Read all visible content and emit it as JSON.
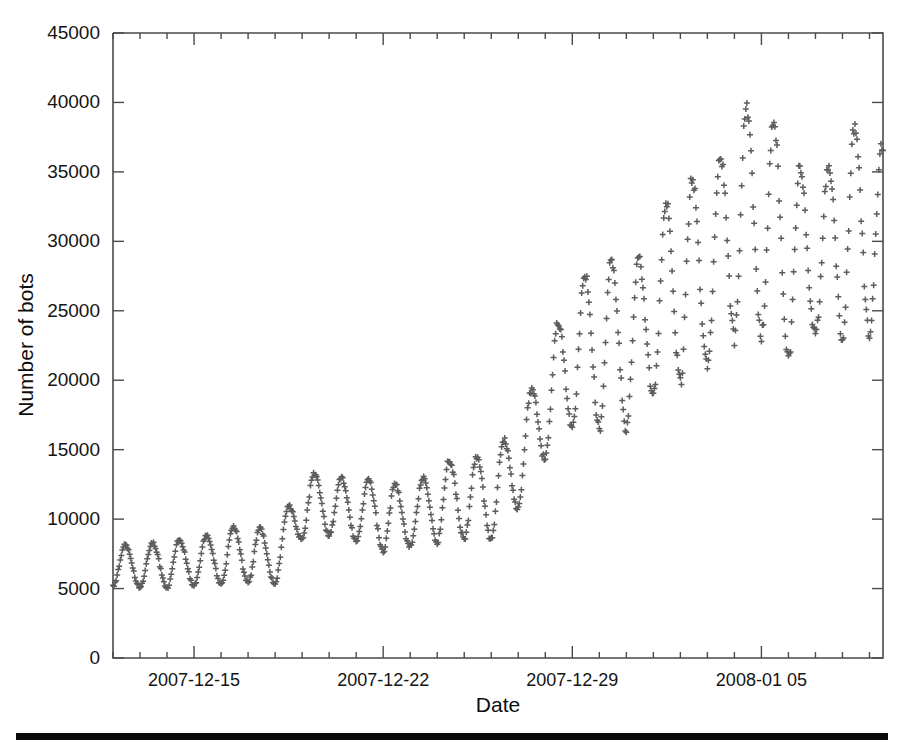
{
  "figure": {
    "background_color": "#ffffff",
    "marker_color": "#5d5d5d",
    "axis_color": "#4a4a4a",
    "rule_color": "#0a0a0a"
  },
  "chart_data": {
    "type": "scatter",
    "title": "",
    "xlabel": "Date",
    "ylabel": "Number of bots",
    "marker": "plus",
    "grid": false,
    "legend": null,
    "ylim": [
      0,
      45000
    ],
    "ytick_labels": [
      "0",
      "5000",
      "10000",
      "15000",
      "20000",
      "25000",
      "30000",
      "35000",
      "40000",
      "45000"
    ],
    "ytick_values": [
      0,
      5000,
      10000,
      15000,
      20000,
      25000,
      30000,
      35000,
      40000,
      45000
    ],
    "xtick_labels": [
      "2007-12-15",
      "2007-12-22",
      "2007-12-29",
      "2008-01 05"
    ],
    "xtick_day_index": [
      3,
      10,
      17,
      24
    ],
    "x_start_label": "2007-12-12",
    "x_end_label": "2008-01-09",
    "x_total_days": 28.5,
    "sampling": "approximately hourly samples showing a strong daily (diurnal) cycle",
    "series": [
      {
        "name": "Number of bots",
        "daily_cycles": [
          {
            "day": 0.0,
            "min": 5150,
            "max": 8200
          },
          {
            "day": 1.0,
            "min": 5050,
            "max": 8100
          },
          {
            "day": 2.0,
            "min": 5100,
            "max": 8500
          },
          {
            "day": 3.0,
            "min": 5200,
            "max": 8600
          },
          {
            "day": 4.0,
            "min": 5350,
            "max": 9200
          },
          {
            "day": 5.0,
            "min": 5400,
            "max": 9800
          },
          {
            "day": 6.0,
            "min": 5300,
            "max": 8700
          },
          {
            "day": 7.0,
            "min": 8700,
            "max": 13300
          },
          {
            "day": 8.0,
            "min": 8900,
            "max": 13300
          },
          {
            "day": 9.0,
            "min": 8400,
            "max": 12700
          },
          {
            "day": 10.0,
            "min": 7600,
            "max": 13000
          },
          {
            "day": 11.0,
            "min": 8000,
            "max": 11900
          },
          {
            "day": 12.0,
            "min": 8400,
            "max": 14300
          },
          {
            "day": 13.0,
            "min": 8600,
            "max": 14200
          },
          {
            "day": 14.0,
            "min": 8500,
            "max": 14800
          },
          {
            "day": 15.0,
            "min": 10700,
            "max": 16800
          },
          {
            "day": 16.0,
            "min": 14400,
            "max": 22200
          },
          {
            "day": 17.0,
            "min": 16700,
            "max": 26500
          },
          {
            "day": 18.0,
            "min": 16500,
            "max": 29200
          },
          {
            "day": 19.0,
            "min": 16600,
            "max": 28300
          },
          {
            "day": 20.0,
            "min": 19000,
            "max": 29500
          },
          {
            "day": 21.0,
            "min": 19700,
            "max": 36400
          },
          {
            "day": 22.0,
            "min": 21200,
            "max": 32300
          },
          {
            "day": 23.0,
            "min": 23100,
            "max": 40400
          },
          {
            "day": 24.0,
            "min": 23300,
            "max": 39100
          },
          {
            "day": 25.0,
            "min": 21200,
            "max": 38000
          },
          {
            "day": 26.0,
            "min": 23400,
            "max": 32300
          },
          {
            "day": 27.0,
            "min": 23100,
            "max": 39100
          },
          {
            "day": 28.0,
            "min": 23300,
            "max": 37400
          }
        ],
        "peaks": [
          8200,
          8100,
          8500,
          8600,
          9200,
          9800,
          8700,
          13300,
          13300,
          12700,
          13000,
          11900,
          14300,
          14200,
          14800,
          16800,
          22200,
          26500,
          29200,
          28300,
          29500,
          36400,
          32300,
          40400,
          39100,
          38000,
          32300,
          39100,
          37400
        ],
        "troughs": [
          5150,
          5050,
          5100,
          5200,
          5350,
          5400,
          5300,
          8700,
          8900,
          8400,
          7600,
          8000,
          8400,
          8600,
          8500,
          10700,
          14400,
          16700,
          16500,
          16600,
          19000,
          19700,
          21200,
          23100,
          23300,
          21200,
          23400,
          23100,
          23300
        ]
      }
    ]
  }
}
